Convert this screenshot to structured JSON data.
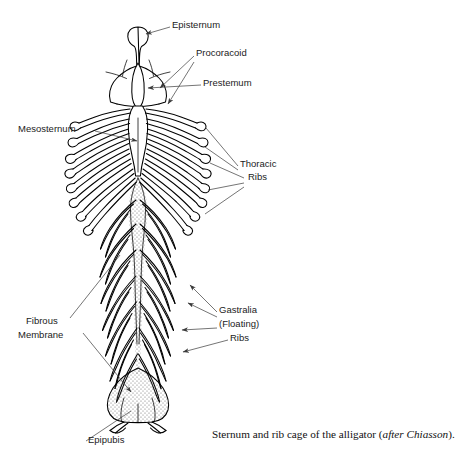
{
  "figure": {
    "title": "Sternum and rib cage of the alligator",
    "view": "ventral",
    "line_art": true
  },
  "caption": {
    "text_before": "Sternum and rib cage of the alligator (",
    "attribution_italic": "after Chiasson",
    "text_after": ")."
  },
  "labels": [
    {
      "id": "episternum",
      "text": "Episternum",
      "x": 172,
      "y": 28,
      "align": "start"
    },
    {
      "id": "procoracoid",
      "text": "Procoracoid",
      "x": 196,
      "y": 56,
      "align": "start"
    },
    {
      "id": "prestemum",
      "text": "Prestemum",
      "x": 203,
      "y": 86,
      "align": "start"
    },
    {
      "id": "mesosternum",
      "text": "Mesosternum",
      "x": 18,
      "y": 132,
      "align": "start"
    },
    {
      "id": "thoracic-1",
      "text": "Thoracic",
      "x": 240,
      "y": 167,
      "align": "start"
    },
    {
      "id": "thoracic-2",
      "text": "Ribs",
      "x": 248,
      "y": 180,
      "align": "start"
    },
    {
      "id": "gastralia-1",
      "text": "Gastralia",
      "x": 219,
      "y": 313,
      "align": "start"
    },
    {
      "id": "gastralia-2",
      "text": "(Floating)",
      "x": 219,
      "y": 327,
      "align": "start"
    },
    {
      "id": "gastralia-3",
      "text": "Ribs",
      "x": 230,
      "y": 341,
      "align": "start"
    },
    {
      "id": "fibrous-1",
      "text": "Fibrous",
      "x": 26,
      "y": 324,
      "align": "start"
    },
    {
      "id": "fibrous-2",
      "text": "Membrane",
      "x": 18,
      "y": 338,
      "align": "start"
    },
    {
      "id": "epipubis",
      "text": "Epipubis",
      "x": 88,
      "y": 443,
      "align": "start"
    }
  ],
  "structures": {
    "episternum": "bulb-shaped rod at cranial midline",
    "procoracoid": "paired slender bars flanking the sternal plate",
    "prestemum": "lens-shaped midline element within sternal plate",
    "mesosternum": "waisted midline column below sternal plate",
    "thoracic_ribs": {
      "pairs": 8,
      "tip": "hooked curled costal cartilages"
    },
    "gastralia": {
      "rows": 7,
      "shape": "chevron / V-shaped floating ribs"
    },
    "fibrous_membrane": "stippled midline band between gastralia",
    "epipubis": "stippled shield with paired caudal prongs"
  },
  "colors": {
    "background": "#ffffff",
    "ink": "#000000",
    "leader": "#3a3a3a",
    "stipple": "#6d6d6d",
    "label_text": "#1b1b1b"
  }
}
